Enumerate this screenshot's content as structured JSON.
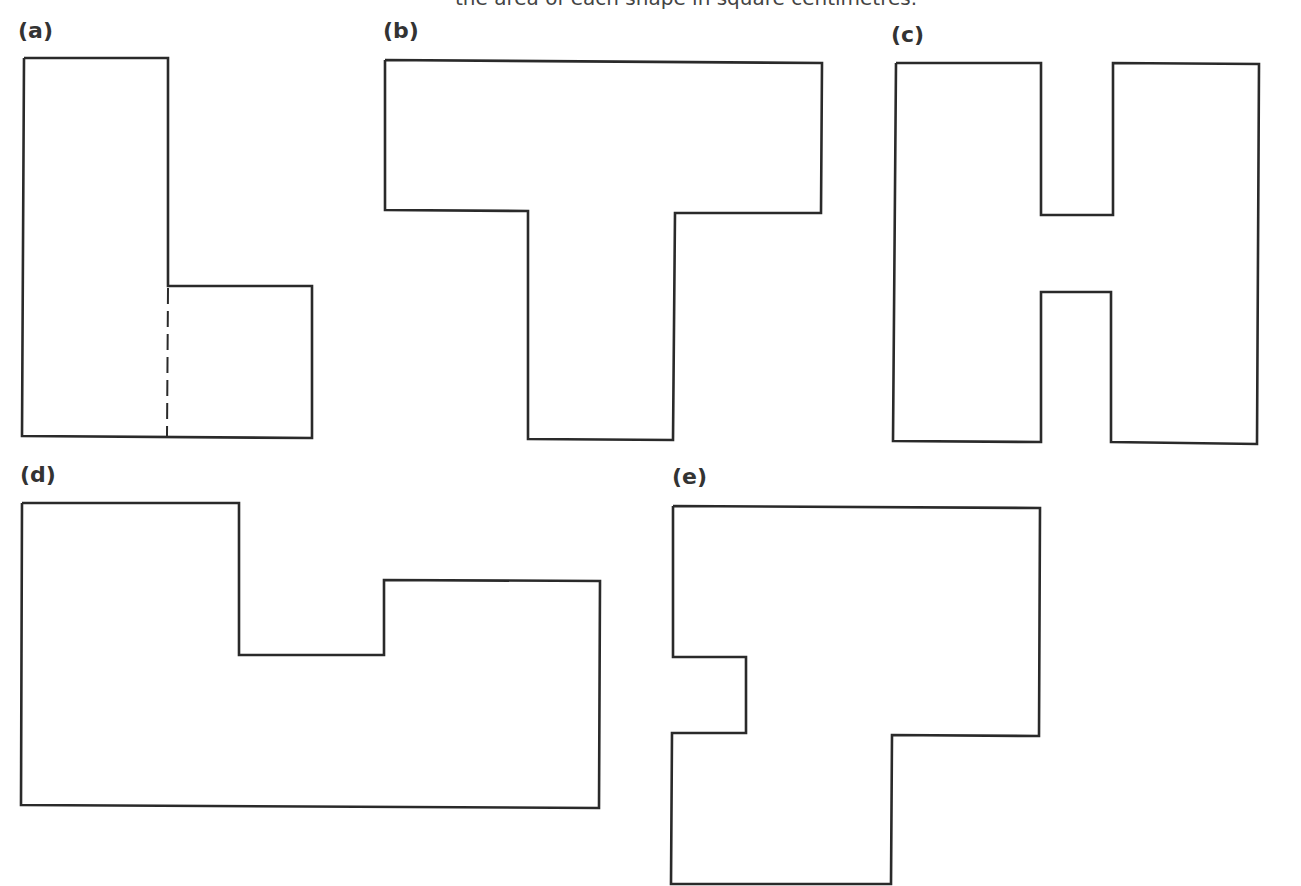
{
  "caption": "the area of each shape in square centimetres.",
  "figures": [
    {
      "label": "(a)",
      "label_pos": [
        18,
        18
      ],
      "points": "24,58 168,58 168,286 312,286 312,438 22,436 24,58",
      "dashed": {
        "x1": 168,
        "y1": 286,
        "x2": 167,
        "y2": 436
      }
    },
    {
      "label": "(b)",
      "label_pos": [
        383,
        18
      ],
      "points": "385,60 822,63 821,213 675,213 673,440 528,439 528,211 385,210 385,60"
    },
    {
      "label": "(c)",
      "label_pos": [
        891,
        22
      ],
      "points": "896,63 1041,63 1041,215 1113,215 1113,63 1259,64 1257,444 1111,442 1111,292 1041,292 1041,442 893,441 896,63"
    },
    {
      "label": "(d)",
      "label_pos": [
        20,
        462
      ],
      "points": "22,503 239,503 239,655 384,655 384,580 600,581 599,808 21,805 22,503"
    },
    {
      "label": "(e)",
      "label_pos": [
        672,
        464
      ],
      "points": "673,506 1040,508 1039,736 892,735 891,884 671,884 672,733 746,733 746,657 673,657 673,506"
    }
  ]
}
